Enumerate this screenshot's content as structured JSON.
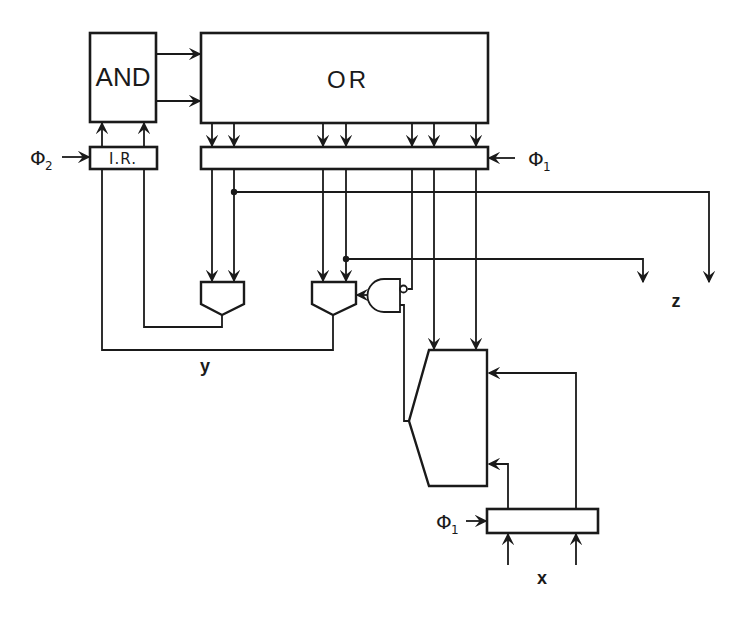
{
  "diagram": {
    "type": "sequential circuit block diagram (PLA with registers and multiplexers)",
    "blocks": {
      "and_plane": "AND",
      "or_plane": "OR",
      "instruction_register": "I.R.",
      "output_register": "",
      "input_register": ""
    },
    "clocks": {
      "phi2": {
        "symbol": "Φ",
        "subscript": "2"
      },
      "phi1_top": {
        "symbol": "Φ",
        "subscript": "1"
      },
      "phi1_bottom": {
        "symbol": "Φ",
        "subscript": "1"
      }
    },
    "signals": {
      "y": "y",
      "z": "z",
      "x": "x"
    },
    "components": [
      "AND plane",
      "OR plane",
      "I.R. register",
      "OR output register",
      "2:1 mux",
      "2:1 mux",
      "NAND gate",
      "large multiplexer",
      "input register"
    ]
  }
}
